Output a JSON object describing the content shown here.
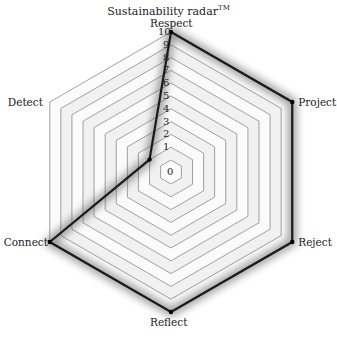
{
  "chart_data": {
    "type": "radar",
    "title": "Sustainability radar",
    "title_mark": "TM",
    "axes": [
      "Respect",
      "Project",
      "Reject",
      "Reflect",
      "Connect",
      "Detect"
    ],
    "series": [
      {
        "name": "Sustainability",
        "values": [
          10,
          10,
          10,
          10,
          10,
          1
        ]
      }
    ],
    "rlim": [
      0,
      10
    ],
    "ticks": [
      "0",
      "1",
      "2",
      "3",
      "4",
      "5",
      "6",
      "7",
      "8",
      "9",
      "10"
    ],
    "grid": true,
    "grid_shape": "hexagon",
    "legend": "none"
  },
  "colors": {
    "line": "#1a1a1a",
    "grid": "#8a8a8a",
    "label": "#222222"
  }
}
